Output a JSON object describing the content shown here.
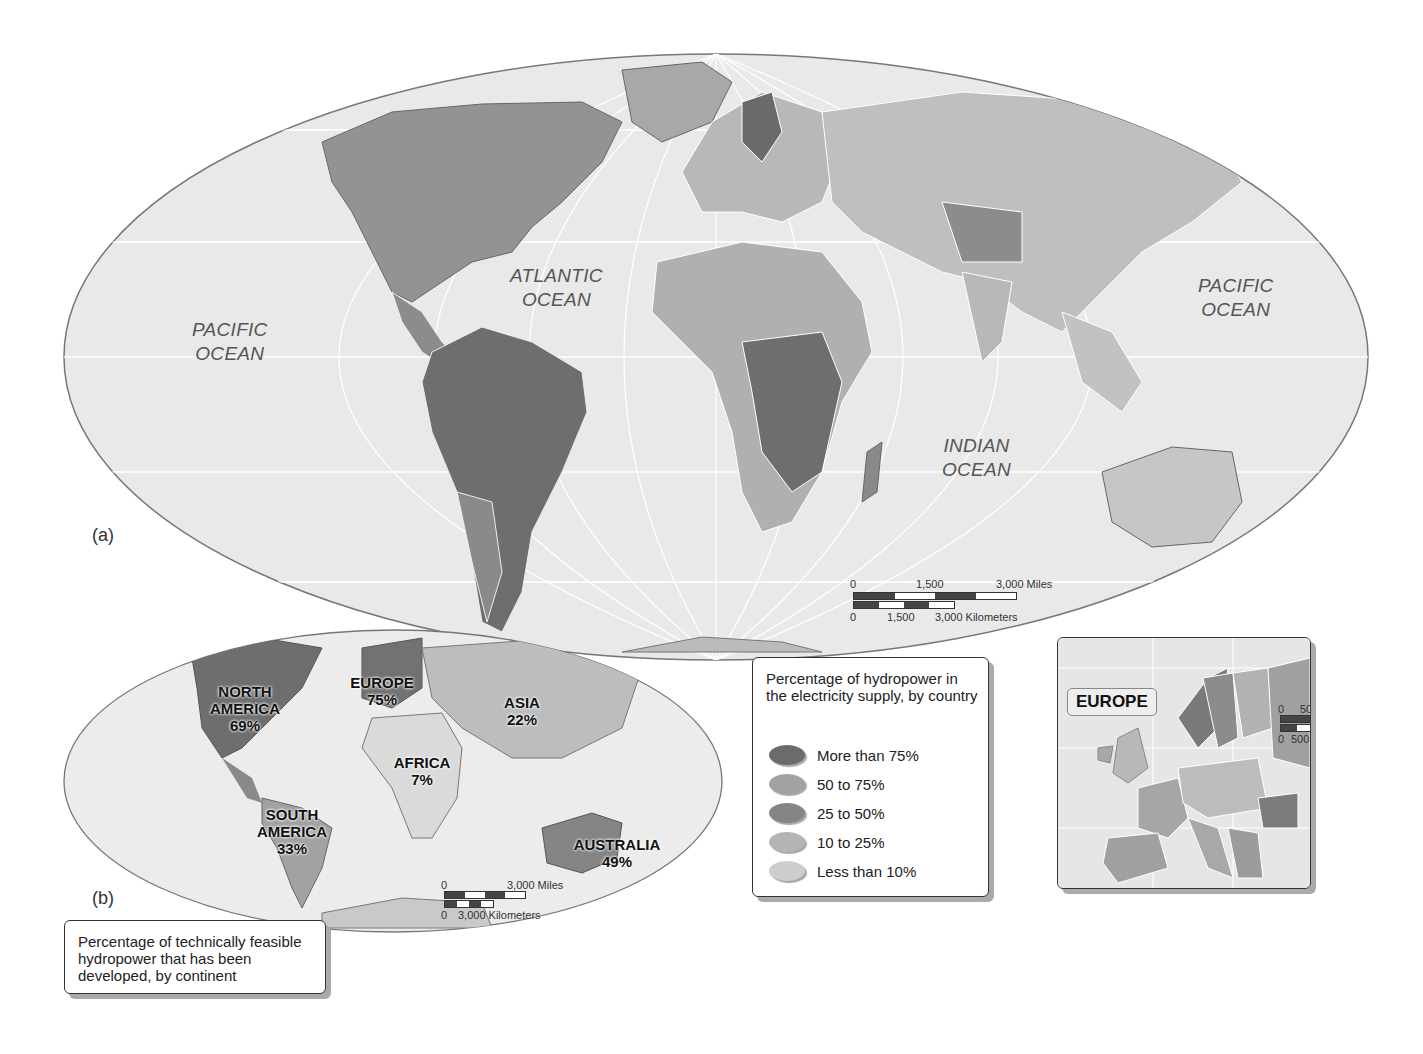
{
  "map_a": {
    "panel_label": "(a)",
    "oceans": [
      {
        "id": "pacific-west",
        "text": "PACIFIC\nOCEAN"
      },
      {
        "id": "atlantic",
        "text": "ATLANTIC\nOCEAN"
      },
      {
        "id": "indian",
        "text": "INDIAN\nOCEAN"
      },
      {
        "id": "pacific-east",
        "text": "PACIFIC\nOCEAN"
      }
    ],
    "scale": {
      "miles": {
        "start": "0",
        "mid": "1,500",
        "end": "3,000 Miles"
      },
      "km": {
        "start": "0",
        "mid": "1,500",
        "end": "3,000 Kilometers"
      }
    }
  },
  "legend": {
    "title": "Percentage of hydropower in the electricity supply, by country",
    "items": [
      {
        "label": "More than 75%",
        "color": "#6b6b6b"
      },
      {
        "label": "50 to 75%",
        "color": "#a2a2a2"
      },
      {
        "label": "25 to 50%",
        "color": "#858585"
      },
      {
        "label": "10 to 25%",
        "color": "#b4b4b4"
      },
      {
        "label": "Less than 10%",
        "color": "#cdcdcd"
      }
    ]
  },
  "map_b": {
    "panel_label": "(b)",
    "caption": "Percentage of technically feasible hydropower that has been developed, by continent",
    "continents": [
      {
        "name": "NORTH AMERICA",
        "value": "69%"
      },
      {
        "name": "EUROPE",
        "value": "75%"
      },
      {
        "name": "ASIA",
        "value": "22%"
      },
      {
        "name": "AFRICA",
        "value": "7%"
      },
      {
        "name": "SOUTH AMERICA",
        "value": "33%"
      },
      {
        "name": "AUSTRALIA",
        "value": "49%"
      }
    ],
    "scale": {
      "miles": {
        "start": "0",
        "end": "3,000 Miles"
      },
      "km": {
        "start": "0",
        "end": "3,000 Kilometers"
      }
    }
  },
  "europe_inset": {
    "title": "EUROPE",
    "scale": {
      "miles": {
        "start": "0",
        "end": "500 Mi"
      },
      "km": {
        "start": "0",
        "end": "500 Km"
      }
    }
  }
}
